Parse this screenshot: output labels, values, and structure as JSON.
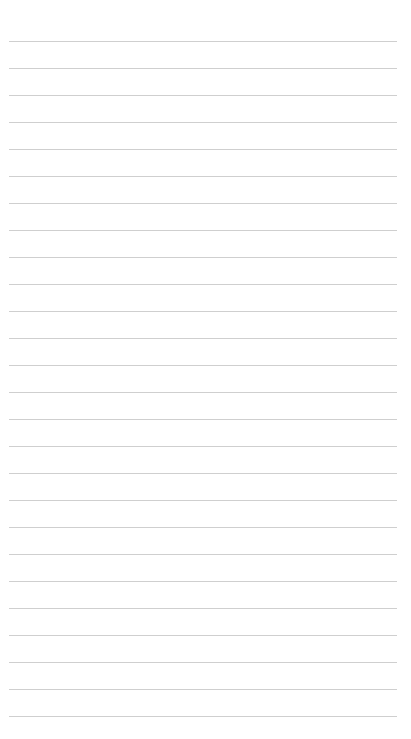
{
  "page": {
    "type": "lined-paper",
    "background_color": "#ffffff",
    "line_color": "#cfcfcf",
    "line_count": 26,
    "first_line_y": 41,
    "line_spacing": 27,
    "line_left": 9,
    "line_right": 397
  }
}
